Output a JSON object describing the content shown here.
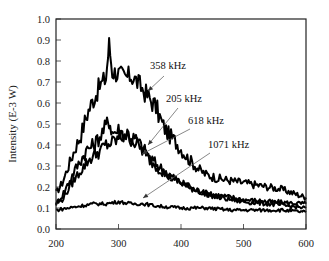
{
  "chart_data": {
    "type": "line",
    "title": "",
    "xlabel": "",
    "ylabel": "Intensity (E-3 W)",
    "xlim": [
      200,
      600
    ],
    "ylim": [
      0.0,
      1.0
    ],
    "x_ticks": [
      "200",
      "300",
      "400",
      "500",
      "600"
    ],
    "y_ticks": [
      "0.0",
      "0.1",
      "0.2",
      "0.3",
      "0.4",
      "0.5",
      "0.6",
      "0.7",
      "0.8",
      "0.9",
      "1.0"
    ],
    "grid": false,
    "legend": "inline annotations with arrows",
    "series": [
      {
        "name": "358 kHz",
        "x": [
          200,
          210,
          220,
          230,
          240,
          250,
          260,
          270,
          280,
          285,
          290,
          300,
          310,
          320,
          330,
          340,
          350,
          360,
          370,
          380,
          390,
          400,
          410,
          420,
          430,
          440,
          450,
          460,
          480,
          500,
          520,
          540,
          560,
          580,
          600
        ],
        "values": [
          0.17,
          0.22,
          0.3,
          0.38,
          0.45,
          0.55,
          0.62,
          0.68,
          0.72,
          0.88,
          0.75,
          0.74,
          0.72,
          0.73,
          0.7,
          0.66,
          0.62,
          0.58,
          0.5,
          0.45,
          0.42,
          0.38,
          0.34,
          0.31,
          0.28,
          0.26,
          0.25,
          0.24,
          0.23,
          0.22,
          0.21,
          0.2,
          0.19,
          0.17,
          0.15
        ],
        "label_pos": [
          150,
          69
        ],
        "arrow": [
          [
            164,
            76
          ],
          [
            148,
            91
          ]
        ]
      },
      {
        "name": "205 kHz",
        "x": [
          200,
          210,
          220,
          230,
          240,
          250,
          260,
          270,
          280,
          285,
          290,
          300,
          310,
          320,
          330,
          340,
          350,
          360,
          380,
          400,
          420,
          440,
          460,
          480,
          500,
          540,
          600
        ],
        "values": [
          0.12,
          0.16,
          0.22,
          0.28,
          0.33,
          0.38,
          0.4,
          0.44,
          0.49,
          0.52,
          0.46,
          0.47,
          0.45,
          0.44,
          0.42,
          0.38,
          0.34,
          0.31,
          0.26,
          0.22,
          0.19,
          0.17,
          0.16,
          0.15,
          0.14,
          0.13,
          0.12
        ],
        "label_pos": [
          166,
          102
        ],
        "arrow": [
          [
            178,
            108
          ],
          [
            148,
            145
          ]
        ]
      },
      {
        "name": "618 kHz",
        "x": [
          200,
          210,
          220,
          230,
          240,
          250,
          260,
          270,
          280,
          290,
          300,
          310,
          320,
          330,
          340,
          350,
          360,
          380,
          400,
          420,
          440,
          460,
          480,
          500,
          540,
          600
        ],
        "values": [
          0.12,
          0.14,
          0.19,
          0.24,
          0.28,
          0.32,
          0.35,
          0.37,
          0.4,
          0.41,
          0.43,
          0.45,
          0.43,
          0.4,
          0.37,
          0.33,
          0.3,
          0.25,
          0.22,
          0.19,
          0.17,
          0.15,
          0.14,
          0.13,
          0.12,
          0.1
        ],
        "label_pos": [
          188,
          124
        ],
        "arrow": [
          [
            190,
            129
          ],
          [
            142,
            154
          ]
        ]
      },
      {
        "name": "1071 kHz",
        "x": [
          200,
          220,
          240,
          260,
          280,
          300,
          320,
          340,
          360,
          400,
          440,
          480,
          520,
          560,
          600
        ],
        "values": [
          0.09,
          0.1,
          0.11,
          0.12,
          0.12,
          0.13,
          0.12,
          0.12,
          0.11,
          0.1,
          0.1,
          0.09,
          0.09,
          0.09,
          0.08
        ],
        "label_pos": [
          208,
          148
        ],
        "arrow": [
          [
            210,
            153
          ],
          [
            143,
            198
          ]
        ]
      }
    ],
    "colors": {
      "line": "#000000",
      "axis": "#222222",
      "arrow": "#555555"
    }
  }
}
